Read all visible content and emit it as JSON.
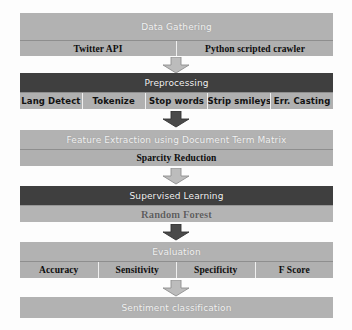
{
  "diagram": {
    "colors": {
      "header_gray": "#b2b2b2",
      "header_dark": "#3f3f3f",
      "subrow_gray": "#b0b0b0",
      "arrow_light": "#b9b9b9",
      "arrow_dark": "#4a4a4a",
      "background": "#fdfdfd"
    },
    "stages": [
      {
        "id": "data-gathering",
        "header": "Data Gathering",
        "header_style": "gray",
        "subrow_label": "",
        "cells": [
          "Twitter API",
          "Python scripted crawler"
        ]
      },
      {
        "id": "preprocessing",
        "header": "Preprocessing",
        "header_style": "dark",
        "cells": [
          "Lang Detect",
          "Tokenize",
          "Stop words",
          "Strip smileys",
          "Err. Casting"
        ]
      },
      {
        "id": "feature-extraction",
        "header": "Feature Extraction using Document Term Matrix",
        "header_style": "gray",
        "cells": [
          "Sparcity Reduction"
        ]
      },
      {
        "id": "supervised-learning",
        "header": "Supervised Learning",
        "header_style": "dark",
        "cells": [
          "Random Forest"
        ]
      },
      {
        "id": "evaluation",
        "header": "Evaluation",
        "header_style": "gray",
        "cells": [
          "Accuracy",
          "Sensitivity",
          "Specificity",
          "F Score"
        ]
      },
      {
        "id": "sentiment-classification",
        "header": "Sentiment classification",
        "header_style": "gray",
        "cells": []
      }
    ],
    "arrows": [
      {
        "id": "arrow-gathering-to-preprocessing",
        "tone": "light"
      },
      {
        "id": "arrow-preprocessing-to-feature",
        "tone": "dark"
      },
      {
        "id": "arrow-feature-to-supervised",
        "tone": "light"
      },
      {
        "id": "arrow-supervised-to-evaluation",
        "tone": "dark"
      },
      {
        "id": "arrow-evaluation-to-sentiment",
        "tone": "light"
      }
    ]
  }
}
